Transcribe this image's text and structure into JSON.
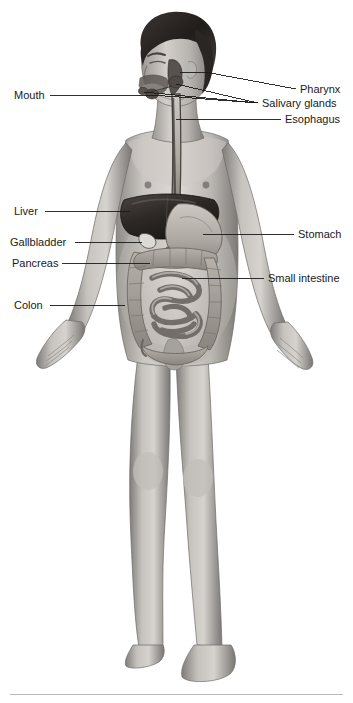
{
  "figure": {
    "width": 353,
    "height": 703,
    "background": "#ffffff",
    "style": "grayscale medical illustration of a standing male figure, anterior view, with digestive organs superimposed on the torso"
  },
  "labels": {
    "mouth": "Mouth",
    "liver": "Liver",
    "gallbladder": "Gallbladder",
    "pancreas": "Pancreas",
    "colon": "Colon",
    "pharynx": "Pharynx",
    "salivary_glands": "Salivary glands",
    "esophagus": "Esophagus",
    "stomach": "Stomach",
    "small_intestine": "Small intestine"
  },
  "colors": {
    "label_text": "#1a1a1a",
    "leader_line": "#1a1a1a",
    "footer_rule": "#b9b9b9",
    "skin_light": "#d8d4d0",
    "skin_mid": "#a9a5a1",
    "skin_dark": "#6e6a67",
    "hair": "#2b2724",
    "liver": "#2f2b28",
    "stomach": "#b4afa9",
    "intestine": "#9a958f",
    "esophagus": "#4a4643"
  },
  "callouts": [
    {
      "name": "mouth",
      "side": "left",
      "text_x": 14,
      "text_y": 89,
      "line_from_x": 50,
      "line_from_y": 95,
      "line_to_x": 152,
      "line_to_y": 95
    },
    {
      "name": "liver",
      "side": "left",
      "text_x": 14,
      "text_y": 205,
      "line_from_x": 45,
      "line_from_y": 211,
      "line_to_x": 130,
      "line_to_y": 211
    },
    {
      "name": "gallbladder",
      "side": "left",
      "text_x": 10,
      "text_y": 236,
      "line_from_x": 75,
      "line_from_y": 242,
      "line_to_x": 142,
      "line_to_y": 242
    },
    {
      "name": "pancreas",
      "side": "left",
      "text_x": 12,
      "text_y": 257,
      "line_from_x": 62,
      "line_from_y": 263,
      "line_to_x": 150,
      "line_to_y": 263
    },
    {
      "name": "colon",
      "side": "left",
      "text_x": 14,
      "text_y": 299,
      "line_from_x": 50,
      "line_from_y": 305,
      "line_to_x": 125,
      "line_to_y": 305
    },
    {
      "name": "pharynx",
      "side": "right",
      "text_x": 300,
      "text_y": 83,
      "line_from_x": 296,
      "line_from_y": 89,
      "line_to_x": 205,
      "line_to_y": 72
    },
    {
      "name": "salivary_glands",
      "side": "right",
      "text_x": 262,
      "text_y": 97,
      "line_from_x": 258,
      "line_from_y": 103,
      "line_to_x": 168,
      "line_to_y": 93
    },
    {
      "name": "esophagus",
      "side": "right",
      "text_x": 285,
      "text_y": 113,
      "line_from_x": 281,
      "line_from_y": 119,
      "line_to_x": 172,
      "line_to_y": 119
    },
    {
      "name": "stomach",
      "side": "right",
      "text_x": 298,
      "text_y": 228,
      "line_from_x": 294,
      "line_from_y": 234,
      "line_to_x": 203,
      "line_to_y": 234
    },
    {
      "name": "small_intestine",
      "side": "right",
      "text_x": 268,
      "text_y": 272,
      "line_from_x": 264,
      "line_from_y": 278,
      "line_to_x": 182,
      "line_to_y": 278
    }
  ]
}
